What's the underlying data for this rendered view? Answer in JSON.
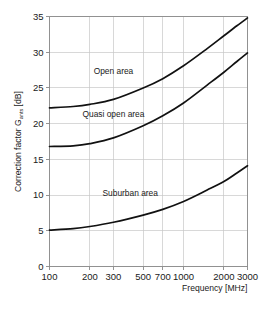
{
  "chart_data": {
    "type": "line",
    "title": "",
    "subtitle": "",
    "xlabel": "Frequency [MHz]",
    "ylabel": "Correction factor G",
    "ylabel_subscript": "ants",
    "ylabel_unit": "[dB]",
    "ylabel_full": "Correction factor Gants [dB]",
    "xscale": "log",
    "yscale": "linear",
    "xlim": [
      100,
      3000
    ],
    "ylim": [
      0,
      35
    ],
    "grid": true,
    "legend": "inline-annotations",
    "xticks": [
      100,
      200,
      300,
      500,
      700,
      1000,
      2000,
      3000
    ],
    "xtick_labels": [
      "100",
      "200",
      "300",
      "500",
      "700",
      "1000",
      "2000",
      "3000"
    ],
    "yticks": [
      0,
      5,
      10,
      15,
      20,
      25,
      30,
      35
    ],
    "ytick_labels": [
      "0",
      "5",
      "10",
      "15",
      "20",
      "25",
      "30",
      "35"
    ],
    "x": [
      100,
      150,
      200,
      300,
      500,
      700,
      1000,
      1500,
      2000,
      2500,
      3000
    ],
    "series": [
      {
        "name": "Open area",
        "label": "Open area",
        "color": "#111111",
        "values": [
          22.2,
          22.4,
          22.7,
          23.4,
          25.0,
          26.3,
          28.1,
          30.5,
          32.3,
          33.7,
          34.8
        ]
      },
      {
        "name": "Quasi open area",
        "label": "Quasi open area",
        "color": "#111111",
        "values": [
          16.8,
          16.9,
          17.2,
          18.0,
          19.7,
          21.1,
          22.9,
          25.4,
          27.2,
          28.7,
          29.9
        ]
      },
      {
        "name": "Suburban area",
        "label": "Suburban area",
        "color": "#111111",
        "values": [
          5.1,
          5.3,
          5.6,
          6.2,
          7.2,
          8.0,
          9.1,
          10.7,
          11.9,
          13.1,
          14.1
        ]
      }
    ],
    "annotations": [
      {
        "text": "Open area",
        "x": 300,
        "y": 27.0
      },
      {
        "text": "Quasi open area",
        "x": 300,
        "y": 20.9
      },
      {
        "text": "Suburban area",
        "x": 400,
        "y": 9.9
      }
    ]
  }
}
